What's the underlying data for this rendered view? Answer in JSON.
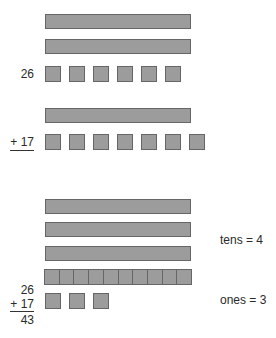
{
  "diagram": {
    "title": "",
    "section1": {
      "addend1_label": "26",
      "addend1": {
        "tens": 2,
        "ones": 6
      },
      "addend2_label": "+ 17",
      "addend2": {
        "tens": 1,
        "ones": 7
      }
    },
    "section2": {
      "sum_lines": [
        "26",
        "+ 17",
        "43"
      ],
      "tens_label": "tens = 4",
      "ones_label": "ones = 3",
      "tens_rods": 3,
      "regrouped_ten_segments": 10,
      "leftover_ones": 3
    },
    "colors": {
      "block_fill": "#9c9c9c",
      "block_border": "#666666",
      "text": "#2a2a2a"
    }
  }
}
